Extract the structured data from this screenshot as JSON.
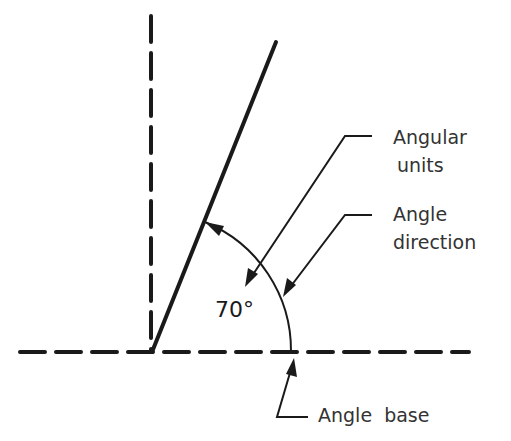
{
  "diagram": {
    "type": "angle-dimension-illustration",
    "angle_value": "70°",
    "labels": {
      "angular_units_line1": "Angular",
      "angular_units_line2": "units",
      "angle_direction_line1": "Angle",
      "angle_direction_line2": "direction",
      "angle_base": "Angle  base"
    },
    "colors": {
      "line": "#1a1a1a",
      "text": "#333333",
      "background": "#ffffff"
    }
  }
}
